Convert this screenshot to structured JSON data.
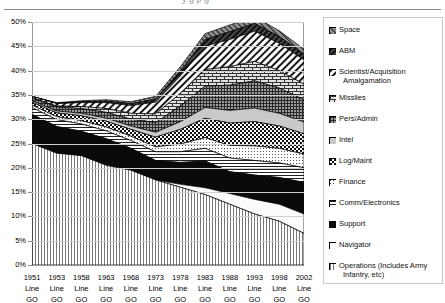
{
  "page": {
    "clipped_title_fragment": "y g p g"
  },
  "chart_data": {
    "type": "area",
    "stacked": true,
    "title": "",
    "xlabel": "",
    "ylabel": "",
    "ylim": [
      0,
      50
    ],
    "yticks": [
      "0%",
      "5%",
      "10%",
      "15%",
      "20%",
      "25%",
      "30%",
      "35%",
      "40%",
      "45%",
      "50%"
    ],
    "ytick_values": [
      0,
      5,
      10,
      15,
      20,
      25,
      30,
      35,
      40,
      45,
      50
    ],
    "grid": true,
    "legend_position": "right",
    "categories": [
      "1951",
      "1953",
      "1958",
      "1963",
      "1968",
      "1973",
      "1978",
      "1983",
      "1988",
      "1993",
      "1998",
      "2002"
    ],
    "category_sublabels": [
      "Line",
      "GO"
    ],
    "series": [
      {
        "name": "Operations (Includes Army Infantry, etc)",
        "pattern": "vertical-lines",
        "values": [
          25.0,
          23.0,
          22.5,
          20.5,
          19.5,
          17.5,
          16.0,
          14.5,
          12.5,
          10.5,
          9.0,
          6.5
        ]
      },
      {
        "name": "Navigator",
        "pattern": "solid-white",
        "values": [
          0.0,
          0.0,
          0.0,
          0.0,
          0.0,
          0.0,
          0.6,
          1.4,
          2.2,
          3.0,
          3.5,
          4.0
        ]
      },
      {
        "name": "Support",
        "pattern": "solid-black",
        "values": [
          6.0,
          5.5,
          5.0,
          5.5,
          4.5,
          4.0,
          4.5,
          5.5,
          4.5,
          5.0,
          5.5,
          6.5
        ]
      },
      {
        "name": "Comm/Electronics",
        "pattern": "horizontal-lines",
        "values": [
          1.4,
          1.4,
          1.5,
          1.6,
          1.6,
          1.8,
          2.2,
          2.6,
          2.8,
          3.0,
          3.0,
          3.0
        ]
      },
      {
        "name": "Finance",
        "pattern": "light-dots",
        "values": [
          0.5,
          0.6,
          0.7,
          0.8,
          0.9,
          1.0,
          1.6,
          2.2,
          2.6,
          3.0,
          3.0,
          2.8
        ]
      },
      {
        "name": "Log/Maint",
        "pattern": "checkerboard",
        "values": [
          0.6,
          0.8,
          1.0,
          1.2,
          1.4,
          2.0,
          3.0,
          4.0,
          4.6,
          5.0,
          4.6,
          4.2
        ]
      },
      {
        "name": "Intel",
        "pattern": "light-grey",
        "values": [
          0.3,
          0.4,
          0.5,
          0.6,
          0.7,
          1.0,
          1.6,
          2.2,
          2.6,
          2.8,
          2.6,
          2.4
        ]
      },
      {
        "name": "Pers/Admin",
        "pattern": "fine-grid",
        "values": [
          0.6,
          0.8,
          1.0,
          1.2,
          1.4,
          2.0,
          3.2,
          4.4,
          5.2,
          5.6,
          5.2,
          4.6
        ]
      },
      {
        "name": "Missiles",
        "pattern": "brick",
        "values": [
          0.0,
          0.2,
          0.4,
          0.8,
          1.2,
          1.8,
          2.6,
          3.4,
          3.8,
          4.0,
          3.6,
          3.2
        ]
      },
      {
        "name": "Scientist/Acquisition Amalgamation",
        "pattern": "diagonal-hatch",
        "values": [
          0.3,
          0.5,
          0.8,
          1.2,
          1.6,
          2.4,
          3.6,
          4.8,
          5.6,
          6.2,
          5.6,
          5.0
        ]
      },
      {
        "name": "ABM",
        "pattern": "dark-diagonal",
        "values": [
          0.0,
          0.1,
          0.2,
          0.3,
          0.4,
          0.6,
          1.0,
          1.4,
          1.6,
          1.6,
          1.4,
          1.2
        ]
      },
      {
        "name": "Space",
        "pattern": "grey-hatch",
        "values": [
          0.0,
          0.1,
          0.2,
          0.3,
          0.4,
          0.6,
          0.9,
          1.2,
          1.4,
          1.4,
          1.2,
          1.0
        ]
      }
    ],
    "totals": [
      34.7,
      33.4,
      33.8,
      33.8,
      33.6,
      34.7,
      40.8,
      47.6,
      49.4,
      51.1,
      48.2,
      44.4
    ]
  },
  "legend": {
    "items": [
      {
        "label": "Space",
        "swatch": "grey-hatch"
      },
      {
        "label": "ABM",
        "swatch": "dark-diagonal"
      },
      {
        "label": "Scientist/Acquisition",
        "label2": "Amalgamation",
        "swatch": "diagonal-hatch"
      },
      {
        "label": "Missiles",
        "swatch": "brick"
      },
      {
        "label": "Pers/Admin",
        "swatch": "fine-grid"
      },
      {
        "label": "Intel",
        "swatch": "light-grey"
      },
      {
        "label": "Log/Maint",
        "swatch": "checkerboard"
      },
      {
        "label": "Finance",
        "swatch": "light-dots"
      },
      {
        "label": "Comm/Electronics",
        "swatch": "horizontal-lines"
      },
      {
        "label": "Support",
        "swatch": "solid-black"
      },
      {
        "label": "Navigator",
        "swatch": "solid-white"
      },
      {
        "label": "Operations (Includes Army",
        "label2": "Infantry, etc)",
        "swatch": "vertical-lines"
      }
    ]
  },
  "colors": {
    "grid": "#cfcfcf",
    "axis": "#9a9a9a",
    "ink": "#000000",
    "legend_border": "#c8c8c8"
  }
}
